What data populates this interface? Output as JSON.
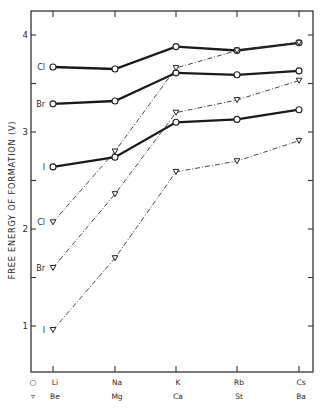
{
  "chart_data": {
    "type": "line",
    "title": "",
    "xlabel": "",
    "ylabel": "FREE ENERGY OF FORMATION (V)",
    "ylim": [
      0.53,
      4.25
    ],
    "yticks": [
      1,
      2,
      3,
      4
    ],
    "yminor_ticks": [
      1.5,
      2.5,
      3.5
    ],
    "grid": false,
    "legend_position": "below x-axis",
    "categories_row1": [
      "Li",
      "Na",
      "K",
      "Rb",
      "Cs"
    ],
    "categories_row2": [
      "Be",
      "Mg",
      "Ca",
      "St",
      "Ba"
    ],
    "row1_marker": "circle",
    "row2_marker": "triangle-down",
    "series": [
      {
        "name": "Cl",
        "group": "alkali",
        "marker": "circle",
        "style": "solid",
        "values": [
          3.67,
          3.65,
          3.88,
          3.84,
          3.92
        ]
      },
      {
        "name": "Br",
        "group": "alkali",
        "marker": "circle",
        "style": "solid",
        "values": [
          3.29,
          3.32,
          3.61,
          3.59,
          3.63
        ]
      },
      {
        "name": "I",
        "group": "alkali",
        "marker": "circle",
        "style": "solid",
        "values": [
          2.64,
          2.74,
          3.1,
          3.13,
          3.23
        ]
      },
      {
        "name": "Cl",
        "group": "alkaline-earth",
        "marker": "triangle-down",
        "style": "dashed",
        "values": [
          2.07,
          2.8,
          3.66,
          3.84,
          3.92
        ]
      },
      {
        "name": "Br",
        "group": "alkaline-earth",
        "marker": "triangle-down",
        "style": "dashed",
        "values": [
          1.6,
          2.36,
          3.2,
          3.33,
          3.53
        ]
      },
      {
        "name": "I",
        "group": "alkaline-earth",
        "marker": "triangle-down",
        "style": "dashed",
        "values": [
          0.96,
          1.7,
          2.59,
          2.7,
          2.91
        ]
      }
    ]
  },
  "axis": {
    "ylabel": "FREE ENERGY OF FORMATION (V)",
    "ytick_labels": [
      "1",
      "2",
      "3",
      "4"
    ]
  },
  "legend": {
    "row1_symbol": "○",
    "row2_symbol": "▿"
  }
}
